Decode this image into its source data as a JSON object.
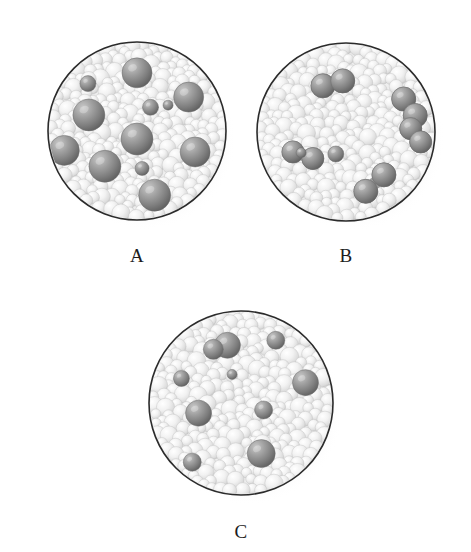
{
  "figure": {
    "background_color": "#ffffff",
    "outline_color": "#2b2b2b",
    "matrix_sphere_color": "#e9e9e9",
    "solute_sphere_color": "#8a8a8a",
    "label_color": "#1c1c1c",
    "panel_count": 3
  },
  "panels": [
    {
      "id": "A",
      "label": "A",
      "cx": 137,
      "cy": 131,
      "r": 89,
      "label_x": 137,
      "label_y": 258,
      "description": "Dense light-gray matrix spheres with many large scattered dark single spheres",
      "solute_arrangement": "single-atoms",
      "solute_count": 12,
      "solute_radius_large": 15,
      "solute_radius_small": 7,
      "solutes": [
        {
          "x": 0.5,
          "y": 0.14,
          "r": 15
        },
        {
          "x": 0.21,
          "y": 0.22,
          "r": 8
        },
        {
          "x": 0.82,
          "y": 0.29,
          "r": 15
        },
        {
          "x": 0.2,
          "y": 0.4,
          "r": 16
        },
        {
          "x": 0.58,
          "y": 0.36,
          "r": 8
        },
        {
          "x": 0.68,
          "y": 0.35,
          "r": 5
        },
        {
          "x": 0.5,
          "y": 0.55,
          "r": 16
        },
        {
          "x": 0.05,
          "y": 0.62,
          "r": 15
        },
        {
          "x": 0.86,
          "y": 0.63,
          "r": 15
        },
        {
          "x": 0.3,
          "y": 0.72,
          "r": 16
        },
        {
          "x": 0.53,
          "y": 0.72,
          "r": 7
        },
        {
          "x": 0.61,
          "y": 0.9,
          "r": 16
        }
      ]
    },
    {
      "id": "B",
      "label": "B",
      "cx": 346,
      "cy": 132,
      "r": 89,
      "label_x": 346,
      "label_y": 258,
      "description": "Dense light-gray matrix spheres with dark spheres joined in diatomic pairs",
      "solute_arrangement": "diatomic-pairs",
      "solute_count": 12,
      "solute_radius_large": 12,
      "solute_radius_small": 7,
      "pairs": [
        {
          "x1": 0.36,
          "y1": 0.22,
          "x2": 0.48,
          "y2": 0.19,
          "r": 12
        },
        {
          "x1": 0.85,
          "y1": 0.3,
          "x2": 0.92,
          "y2": 0.4,
          "r": 12
        },
        {
          "x1": 0.89,
          "y1": 0.48,
          "x2": 0.95,
          "y2": 0.56,
          "r": 11
        },
        {
          "x1": 0.18,
          "y1": 0.62,
          "x2": 0.3,
          "y2": 0.66,
          "r": 11
        },
        {
          "x1": 0.73,
          "y1": 0.76,
          "x2": 0.62,
          "y2": 0.86,
          "r": 12
        }
      ],
      "singles": [
        {
          "x": 0.44,
          "y": 0.63,
          "r": 8
        },
        {
          "x": 0.24,
          "y": 0.62,
          "r": 5
        }
      ]
    },
    {
      "id": "C",
      "label": "C",
      "cx": 241,
      "cy": 403,
      "r": 92,
      "label_x": 241,
      "label_y": 534,
      "description": "Dense light-gray matrix spheres with fewer, smaller scattered dark spheres",
      "solute_arrangement": "single-atoms-dilute",
      "solute_count": 10,
      "solute_radius_large": 13,
      "solute_radius_small": 7,
      "solutes": [
        {
          "x": 0.42,
          "y": 0.16,
          "r": 13
        },
        {
          "x": 0.34,
          "y": 0.19,
          "r": 10
        },
        {
          "x": 0.7,
          "y": 0.14,
          "r": 9
        },
        {
          "x": 0.16,
          "y": 0.36,
          "r": 8
        },
        {
          "x": 0.88,
          "y": 0.38,
          "r": 13
        },
        {
          "x": 0.25,
          "y": 0.56,
          "r": 13
        },
        {
          "x": 0.63,
          "y": 0.54,
          "r": 9
        },
        {
          "x": 0.62,
          "y": 0.8,
          "r": 14
        },
        {
          "x": 0.22,
          "y": 0.84,
          "r": 9
        },
        {
          "x": 0.45,
          "y": 0.34,
          "r": 5
        }
      ]
    }
  ]
}
